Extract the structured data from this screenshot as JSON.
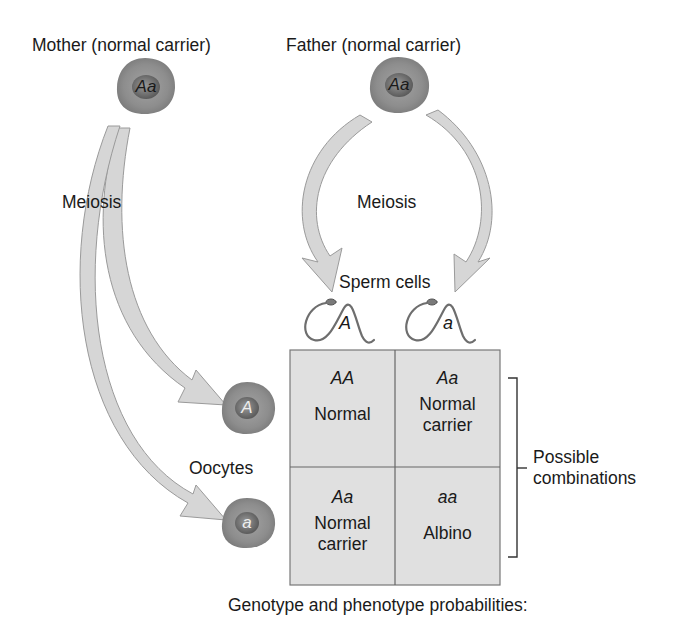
{
  "title": "Genotype and phenotype probabilities:",
  "parents": {
    "mother": {
      "label": "Mother (normal carrier)",
      "genotype": "Aa"
    },
    "father": {
      "label": "Father (normal carrier)",
      "genotype": "Aa"
    }
  },
  "process": {
    "mother_meiosis": "Meiosis",
    "father_meiosis": "Meiosis"
  },
  "gametes": {
    "sperm_label": "Sperm cells",
    "sperm": [
      {
        "allele": "A"
      },
      {
        "allele": "a"
      }
    ],
    "oocyte_label": "Oocytes",
    "oocytes": [
      {
        "allele": "A"
      },
      {
        "allele": "a"
      }
    ]
  },
  "punnett": {
    "rows": [
      [
        {
          "genotype": "AA",
          "phenotype": "Normal"
        },
        {
          "genotype": "Aa",
          "phenotype": "Normal carrier"
        }
      ],
      [
        {
          "genotype": "Aa",
          "phenotype": "Normal carrier"
        },
        {
          "genotype": "aa",
          "phenotype": "Albino"
        }
      ]
    ]
  },
  "bracket_label": "Possible combinations",
  "colors": {
    "cell_fill": "#8a8a8a",
    "nucleus_fill": "#5e5e5e",
    "arrow_fill": "#d4d4d4",
    "arrow_edge": "#8c8c8c",
    "grid_fill": "#e0e0e0",
    "grid_line": "#707070"
  }
}
